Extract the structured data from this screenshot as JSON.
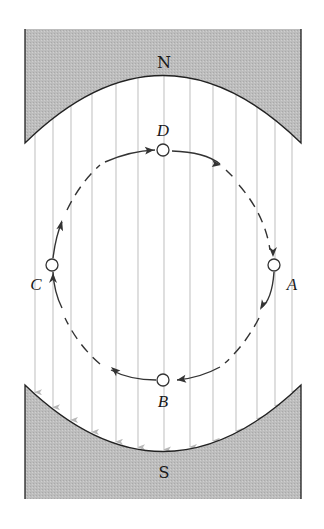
{
  "diagram": {
    "colors": {
      "pole_fill": "#bdbdbd",
      "pole_edge": "#222222",
      "field_line": "#c4c4c4",
      "orbit": "#333333",
      "point_stroke": "#333333",
      "background": "#ffffff"
    },
    "poles": [
      {
        "id": "north",
        "label": "N",
        "label_pos": [
          164,
          64
        ]
      },
      {
        "id": "south",
        "label": "S",
        "label_pos": [
          164,
          476
        ]
      }
    ],
    "field": {
      "direction": "downward (N to S)",
      "line_x": [
        35,
        53,
        71,
        92,
        116,
        138,
        164,
        190,
        213,
        236,
        257,
        275,
        292
      ]
    },
    "orbit": {
      "center": [
        163,
        265
      ],
      "rx": 111,
      "ry": 115,
      "direction": "clockwise (D → A → B → C → D)",
      "style": "dashed with arrows"
    },
    "points": [
      {
        "id": "D",
        "label": "D",
        "cx": 163,
        "cy": 150,
        "label_x": 163,
        "label_y": 134
      },
      {
        "id": "A",
        "label": "A",
        "cx": 274,
        "cy": 265,
        "label_x": 292,
        "label_y": 290
      },
      {
        "id": "B",
        "label": "B",
        "cx": 163,
        "cy": 380,
        "label_x": 163,
        "label_y": 406
      },
      {
        "id": "C",
        "label": "C",
        "cx": 52,
        "cy": 265,
        "label_x": 36,
        "label_y": 290
      }
    ]
  }
}
